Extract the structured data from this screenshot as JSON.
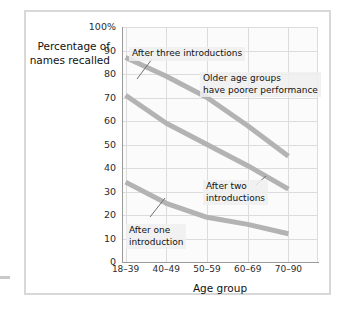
{
  "figure": {
    "background": "#ffffff",
    "frame_color": "#d8d8d8"
  },
  "axes": {
    "ylabel": "Percentage\nof names\nrecalled",
    "xlabel": "Age group",
    "ytick_labels": [
      "100%",
      "90",
      "80",
      "70",
      "60",
      "50",
      "40",
      "30",
      "20",
      "10",
      "0"
    ],
    "xtick_labels": [
      "18–39",
      "40–49",
      "50–59",
      "60–69",
      "70–90"
    ]
  },
  "annotations": {
    "three": "After three introductions",
    "older": "Older age groups\nhave poorer performance",
    "two": "After two\nintroductions",
    "one": "After one\nintroduction"
  },
  "colors": {
    "line": "#b3b3b3",
    "grid": "#dcdcdc",
    "axis": "#9a9a9a",
    "text": "#111111",
    "plot_bg": "#fbfbfb"
  },
  "chart_data": {
    "type": "line",
    "title": "",
    "xlabel": "Age group",
    "ylabel": "Percentage of names recalled",
    "categories": [
      "18–39",
      "40–49",
      "50–59",
      "60–69",
      "70–90"
    ],
    "ylim": [
      0,
      100
    ],
    "yticks": [
      0,
      10,
      20,
      30,
      40,
      50,
      60,
      70,
      80,
      90,
      100
    ],
    "grid": true,
    "legend": "annotations-inline",
    "series": [
      {
        "name": "After three introductions",
        "values": [
          87,
          79,
          70,
          58,
          45
        ]
      },
      {
        "name": "After two introductions",
        "values": [
          71,
          59,
          50,
          41,
          31
        ]
      },
      {
        "name": "After one introduction",
        "values": [
          34,
          25,
          19,
          16,
          12
        ]
      }
    ]
  }
}
